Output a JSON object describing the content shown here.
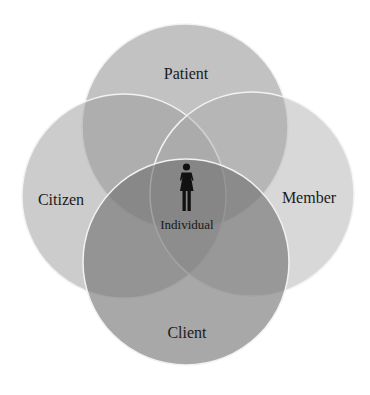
{
  "diagram": {
    "type": "venn",
    "center_label": "Individual",
    "center_icon": "person-female-icon",
    "sets": [
      {
        "id": "patient",
        "label": "Patient",
        "cx": 185,
        "cy": 127,
        "r": 103,
        "fill": "#8f8f8f",
        "opacity": 0.55
      },
      {
        "id": "citizen",
        "label": "Citizen",
        "cx": 124,
        "cy": 196,
        "r": 102,
        "fill": "#9a9a9a",
        "opacity": 0.5
      },
      {
        "id": "member",
        "label": "Member",
        "cx": 252,
        "cy": 194,
        "r": 102,
        "fill": "#a8a8a8",
        "opacity": 0.45
      },
      {
        "id": "client",
        "label": "Client",
        "cx": 186,
        "cy": 262,
        "r": 103,
        "fill": "#6e6e6e",
        "opacity": 0.6
      }
    ],
    "colors": {
      "background": "#ffffff",
      "stroke": "#f2f2f2",
      "text": "#1a1a1a",
      "icon": "#111111"
    }
  }
}
